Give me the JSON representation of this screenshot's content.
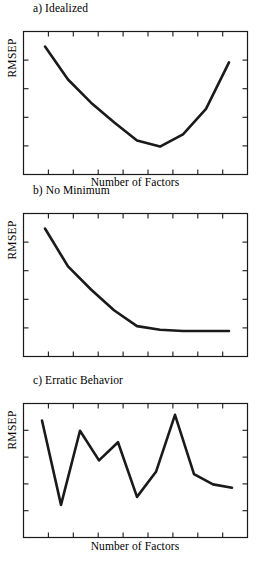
{
  "figure": {
    "axis_label_x": "Number of Factors",
    "axis_label_y": "RMSEP",
    "line_color": "#1a1a1a",
    "frame_color": "#1a1a1a",
    "background_color": "#ffffff"
  },
  "panels": [
    {
      "id": "a",
      "title": "a) Idealized"
    },
    {
      "id": "b",
      "title": "b) No Minimum"
    },
    {
      "id": "c",
      "title": "c) Erratic Behavior"
    }
  ],
  "chart_data": [
    {
      "type": "line",
      "title": "a) Idealized",
      "xlabel": "Number of Factors",
      "ylabel": "RMSEP",
      "xlim": [
        0,
        10
      ],
      "ylim": [
        0,
        10
      ],
      "grid": false,
      "legend": null,
      "tick_labels_x": [],
      "tick_labels_y": [],
      "x": [
        1,
        2,
        3,
        4,
        5,
        6,
        7,
        8,
        9
      ],
      "values": [
        9.3,
        6.6,
        4.7,
        3.1,
        1.6,
        1.1,
        2.1,
        4.2,
        8.0
      ]
    },
    {
      "type": "line",
      "title": "b) No Minimum",
      "xlabel": "Number of Factors",
      "ylabel": "RMSEP",
      "xlim": [
        0,
        10
      ],
      "ylim": [
        0,
        10
      ],
      "grid": false,
      "legend": null,
      "tick_labels_x": [],
      "tick_labels_y": [],
      "x": [
        1,
        2,
        3,
        4,
        5,
        6,
        7,
        8,
        9
      ],
      "values": [
        9.3,
        6.2,
        4.3,
        2.6,
        1.3,
        1.0,
        0.9,
        0.9,
        0.9
      ]
    },
    {
      "type": "line",
      "title": "c) Erratic Behavior",
      "xlabel": "Number of Factors",
      "ylabel": "RMSEP",
      "xlim": [
        0,
        12
      ],
      "ylim": [
        0,
        10
      ],
      "grid": false,
      "legend": null,
      "tick_labels_x": [],
      "tick_labels_y": [],
      "x": [
        1,
        2,
        3,
        4,
        5,
        6,
        7,
        8,
        9,
        10,
        11
      ],
      "values": [
        8.9,
        1.5,
        8.0,
        5.4,
        7.0,
        2.2,
        4.4,
        9.4,
        4.2,
        3.3,
        3.0
      ]
    }
  ]
}
